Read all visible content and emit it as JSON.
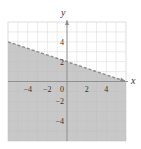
{
  "chart_data": {
    "type": "area",
    "title": "",
    "xlabel": "x",
    "ylabel": "y",
    "xlim": [
      -6,
      6
    ],
    "ylim": [
      -6,
      6
    ],
    "grid": true,
    "x_ticks": [
      -4,
      -2,
      0,
      2,
      4
    ],
    "y_ticks": [
      4,
      2,
      -2,
      -4
    ],
    "x_tick_labels": [
      "−4",
      "−2",
      "0",
      "2",
      "4"
    ],
    "y_tick_labels": [
      "4",
      "2",
      "−2",
      "−4"
    ],
    "boundary_line": {
      "equation": "y = -x/3 + 2",
      "slope": -0.3333,
      "intercept": 2,
      "style": "dashed",
      "points": [
        [
          -6,
          4
        ],
        [
          6,
          0
        ]
      ]
    },
    "shaded_region": "below",
    "inequality": "y < -x/3 + 2",
    "colors": {
      "shade": "#c8c8c8",
      "grid": "#e2e2e2",
      "axis": "#8a8a8a",
      "line": "#8c8c8c"
    }
  },
  "labels": {
    "x_axis": "x",
    "y_axis": "y"
  }
}
